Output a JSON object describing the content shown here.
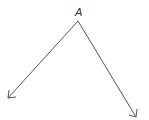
{
  "diagram": {
    "type": "angle",
    "vertex": {
      "label": "A",
      "x": 78,
      "y": 21
    },
    "rays": [
      {
        "name": "left-ray",
        "from": [
          78,
          21
        ],
        "to": [
          8,
          98
        ]
      },
      {
        "name": "right-ray",
        "from": [
          78,
          21
        ],
        "to": [
          136,
          117
        ]
      }
    ],
    "colors": {
      "stroke": "#555555",
      "label": "#333333"
    }
  }
}
